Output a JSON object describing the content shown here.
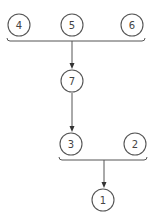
{
  "diagram": {
    "type": "tree",
    "colors": {
      "stroke": "#555555",
      "text": "#444444",
      "background": "#ffffff"
    },
    "nodes": [
      {
        "id": "n4",
        "label": "4",
        "cx": 19,
        "cy": 25
      },
      {
        "id": "n5",
        "label": "5",
        "cx": 72,
        "cy": 25
      },
      {
        "id": "n6",
        "label": "6",
        "cx": 132,
        "cy": 25
      },
      {
        "id": "n7",
        "label": "7",
        "cx": 72,
        "cy": 81
      },
      {
        "id": "n3",
        "label": "3",
        "cx": 71,
        "cy": 144
      },
      {
        "id": "n2",
        "label": "2",
        "cx": 135,
        "cy": 144
      },
      {
        "id": "n1",
        "label": "1",
        "cx": 103,
        "cy": 200
      }
    ],
    "groups": [
      {
        "id": "g1",
        "members": [
          "4",
          "5",
          "6"
        ],
        "target": "7"
      },
      {
        "id": "g2",
        "members": [
          "3",
          "2"
        ],
        "target": "1"
      }
    ],
    "edges": [
      {
        "from": "group(4,5,6)",
        "to": "7"
      },
      {
        "from": "7",
        "to": "3"
      },
      {
        "from": "group(3,2)",
        "to": "1"
      }
    ]
  }
}
